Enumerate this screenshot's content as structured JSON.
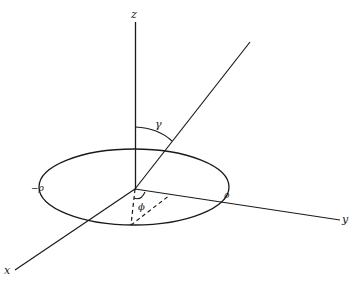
{
  "diagram": {
    "type": "3d-coordinate-geometry",
    "colors": {
      "line": "#1a1a1a",
      "background": "#ffffff"
    },
    "labels": {
      "z_axis": "z",
      "y_axis": "y",
      "x_axis": "x",
      "gamma": "γ",
      "phi": "ϕ",
      "rho_pos": "ρ",
      "rho_neg": "−ρ"
    },
    "elements": [
      "z-axis (vertical)",
      "y-axis (to right)",
      "x-axis (to lower-left)",
      "circle of radius rho in xy-plane (drawn as ellipse)",
      "ray from origin at angle gamma from z-axis",
      "angle arc gamma between z-axis and ray",
      "dashed projection lines in plane",
      "angle arc phi at origin"
    ]
  }
}
